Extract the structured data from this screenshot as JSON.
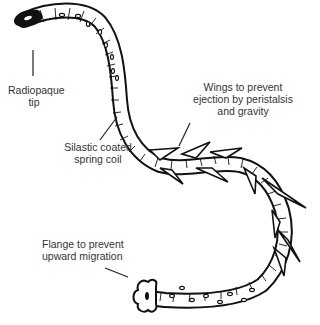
{
  "diagram": {
    "colors": {
      "line": "#111111",
      "fill": "#ffffff",
      "text": "#333333"
    },
    "labels": [
      {
        "id": "radiopaque-tip",
        "lines": [
          "Radiopaque",
          "tip"
        ]
      },
      {
        "id": "silastic-coil",
        "lines": [
          "Silastic coated",
          "spring coil"
        ]
      },
      {
        "id": "wings",
        "lines": [
          "Wings to prevent",
          "ejection by peristalsis",
          "and gravity"
        ]
      },
      {
        "id": "flange",
        "lines": [
          "Flange to prevent",
          "upward migration"
        ]
      }
    ]
  }
}
